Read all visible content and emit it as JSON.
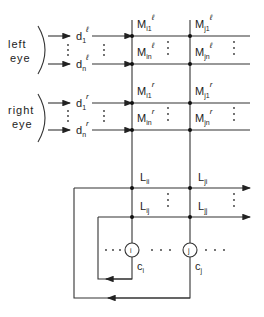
{
  "diagram": {
    "eyes": {
      "left": [
        "left",
        "eye"
      ],
      "right": [
        "right",
        "eye"
      ]
    },
    "inputs": {
      "left": [
        {
          "base": "d",
          "sub": "1",
          "sup": "ℓ"
        },
        {
          "base": "d",
          "sub": "n",
          "sup": "ℓ"
        }
      ],
      "right": [
        {
          "base": "d",
          "sub": "1",
          "sup": "r"
        },
        {
          "base": "d",
          "sub": "n",
          "sup": "r"
        }
      ]
    },
    "weights_left": [
      {
        "base": "M",
        "sub": "i1",
        "sup": "ℓ"
      },
      {
        "base": "M",
        "sub": "j1",
        "sup": "ℓ"
      },
      {
        "base": "M",
        "sub": "in",
        "sup": "ℓ"
      },
      {
        "base": "M",
        "sub": "jn",
        "sup": "ℓ"
      }
    ],
    "weights_right": [
      {
        "base": "M",
        "sub": "i1",
        "sup": "r"
      },
      {
        "base": "M",
        "sub": "j1",
        "sup": "r"
      },
      {
        "base": "M",
        "sub": "in",
        "sup": "r"
      },
      {
        "base": "M",
        "sub": "jn",
        "sup": "r"
      }
    ],
    "lateral": [
      {
        "base": "L",
        "sub": "ii"
      },
      {
        "base": "L",
        "sub": "ji"
      },
      {
        "base": "L",
        "sub": "ij"
      },
      {
        "base": "L",
        "sub": "jj"
      }
    ],
    "cells": [
      {
        "symbol": "i",
        "output_base": "c",
        "output_sub": "i"
      },
      {
        "symbol": "j",
        "output_base": "c",
        "output_sub": "j"
      }
    ],
    "ellipsis": "· · ·"
  }
}
